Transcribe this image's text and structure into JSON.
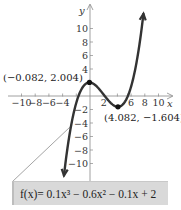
{
  "chart_data": {
    "type": "line",
    "title": "",
    "xlabel": "x",
    "ylabel": "y",
    "xlim": [
      -10,
      10
    ],
    "ylim": [
      -10,
      10
    ],
    "x_ticks": [
      -10,
      -8,
      -6,
      -4,
      -2,
      2,
      4,
      6,
      8,
      10
    ],
    "x_tick_labels": [
      "−10",
      "−8",
      "−6",
      "−4",
      "",
      "2",
      "",
      "6",
      "8",
      "10"
    ],
    "y_ticks": [
      10,
      8,
      6,
      4,
      2,
      -2,
      -4,
      -6,
      -8,
      -10
    ],
    "y_tick_labels": [
      "10",
      "8",
      "6",
      "4",
      "",
      "−2",
      "−4",
      "−6",
      "−8",
      "−10"
    ],
    "grid": false,
    "series": [
      {
        "name": "f(x) = 0.1x^3 - 0.6x^2 - 0.1x + 2",
        "coefficients": {
          "a3": 0.1,
          "a2": -0.6,
          "a1": -0.1,
          "a0": 2
        },
        "x_range": [
          -3.8,
          7.8
        ],
        "arrows_at_ends": true,
        "color": "#333333"
      }
    ],
    "points": [
      {
        "x": -0.082,
        "y": 2.004,
        "label": "(−0.082, 2.004)",
        "kind": "relative maximum"
      },
      {
        "x": 4.082,
        "y": -1.604,
        "label": "(4.082, −1.604)",
        "kind": "relative minimum"
      }
    ],
    "equation_label": "f(x)= 0.1x³ − 0.6x² − 0.1x + 2"
  }
}
